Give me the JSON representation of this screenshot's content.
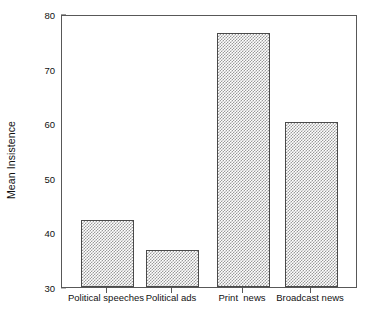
{
  "chart_data": {
    "type": "bar",
    "title": "",
    "subtitle": "",
    "xlabel": "",
    "ylabel": "Mean Insistence",
    "categories": [
      "Political speeches",
      "Political ads",
      "Print  news",
      "Broadcast news"
    ],
    "values": [
      42.2,
      36.7,
      76.5,
      60.3
    ],
    "ylim": [
      30,
      80
    ],
    "yticks": [
      30,
      40,
      50,
      60,
      70,
      80
    ],
    "ytick_labels": [
      "30",
      "40",
      "50",
      "60",
      "70",
      "80"
    ],
    "grid": false,
    "legend": null,
    "legend_position": "none",
    "bar_fill": "hatched-gray",
    "bar_edge_color": "#4a4a4a",
    "frame_color": "#585858",
    "background_color": "#ffffff"
  },
  "axes": {
    "y_title": "Mean Insistence",
    "y_tick_labels": [
      "80",
      "70",
      "60",
      "50",
      "40",
      "30"
    ],
    "x_tick_labels": [
      "Political speeches",
      "Political ads",
      "Print  news",
      "Broadcast news"
    ]
  }
}
